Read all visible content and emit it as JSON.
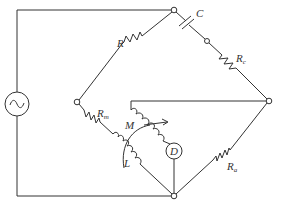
{
  "diagram": {
    "components": {
      "source": {
        "symbol": "~",
        "label": ""
      },
      "capacitor": {
        "label": "C"
      },
      "resistor_r": {
        "label": "R"
      },
      "resistor_rc": {
        "label": "R",
        "subscript": "c"
      },
      "resistor_rm": {
        "label": "R",
        "subscript": "m"
      },
      "resistor_ra": {
        "label": "R",
        "subscript": "a"
      },
      "mutual": {
        "label": "M"
      },
      "inductor": {
        "label": "L"
      },
      "detector": {
        "label": "D"
      }
    },
    "colors": {
      "line": "#333333",
      "background": "#ffffff"
    }
  }
}
